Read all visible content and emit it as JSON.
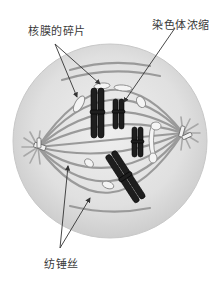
{
  "diagram": {
    "labels": {
      "nuclear_membrane_fragments": "核膜的碎片",
      "chromosome_condensation": "染色体浓缩",
      "spindle_fibers": "纺锤丝"
    },
    "colors": {
      "cell_fill": "#e2e2e2",
      "cell_rim": "#cfcfcf",
      "spindle": "#9a9a9a",
      "chromosome": "#1e1e1e",
      "fragment": "#f4f4f4",
      "leader_line": "#333333",
      "text": "#3a3a3a"
    }
  }
}
